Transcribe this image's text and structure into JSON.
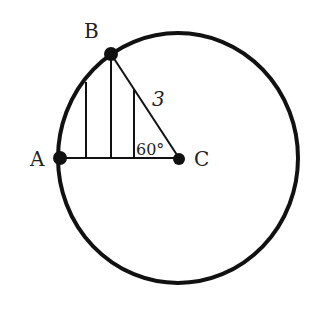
{
  "diagram": {
    "type": "geometry-circle-sector",
    "points": {
      "A": {
        "label": "A"
      },
      "B": {
        "label": "B"
      },
      "C": {
        "label": "C"
      }
    },
    "segment_label": "3",
    "angle_label": "60°",
    "colors": {
      "stroke": "#111111",
      "background": "#ffffff",
      "text": "#222222"
    }
  }
}
